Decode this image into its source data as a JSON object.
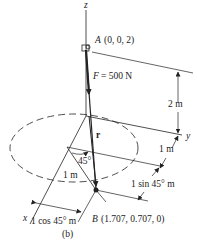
{
  "figure": {
    "caption": "(b)",
    "axes": {
      "z": "z",
      "x": "x",
      "y": "y"
    },
    "points": {
      "A": {
        "name": "A",
        "coords": "(0, 0, 2)"
      },
      "B": {
        "name": "B",
        "coords": "(1.707, 0.707, 0)"
      }
    },
    "force": {
      "label": "F = 500 N",
      "symbol": "F",
      "value": "= 500 N"
    },
    "position_vector": "r",
    "angle": "45°",
    "dimensions": {
      "height": "2 m",
      "radius": "1 m",
      "y_offset": "1 m",
      "sin_component": "1 sin 45° m",
      "cos_component": "1 cos 45° m"
    },
    "colors": {
      "line": "#222222",
      "background": "#ffffff"
    }
  }
}
